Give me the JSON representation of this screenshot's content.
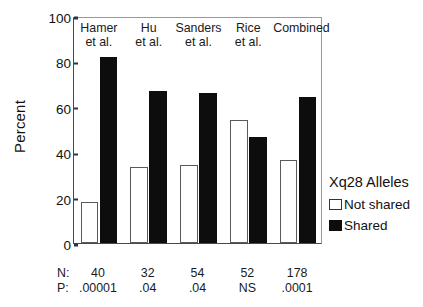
{
  "chart_data": {
    "type": "bar",
    "title": "",
    "xlabel": "",
    "ylabel": "Percent",
    "ylim": [
      0,
      100
    ],
    "yticks": [
      0,
      20,
      40,
      60,
      80,
      100
    ],
    "ytick_labels": [
      "0",
      "20",
      "40",
      "60",
      "80",
      "100"
    ],
    "grid": false,
    "legend_position": "right",
    "categories": [
      "Hamer et al.",
      "Hu et al.",
      "Sanders et al.",
      "Rice et al.",
      "Combined"
    ],
    "category_lines": [
      [
        "Hamer",
        "et al."
      ],
      [
        "Hu",
        "et al."
      ],
      [
        "Sanders",
        "et al."
      ],
      [
        "Rice",
        "et al."
      ],
      [
        "Combined",
        ""
      ]
    ],
    "series": [
      {
        "name": "Not shared",
        "color": "#ffffff",
        "edgecolor": "#5a5a5a",
        "values": [
          18,
          33.5,
          34.5,
          54,
          36.5
        ]
      },
      {
        "name": "Shared",
        "color": "#0d0d0d",
        "edgecolor": "#0d0d0d",
        "values": [
          82,
          67,
          66,
          46.5,
          64.5
        ]
      }
    ],
    "annotations": {
      "n_row_label": "N:",
      "p_row_label": "P:",
      "n_values": [
        "40",
        "32",
        "54",
        "52",
        "178"
      ],
      "p_values": [
        ".00001",
        ".04",
        ".04",
        "NS",
        ".0001"
      ]
    }
  },
  "legend": {
    "title": "Xq28 Alleles",
    "items": [
      {
        "label": "Not shared",
        "swatch": "white-square"
      },
      {
        "label": "Shared",
        "swatch": "black-square"
      }
    ]
  },
  "axis": {
    "y_title": "Percent"
  }
}
